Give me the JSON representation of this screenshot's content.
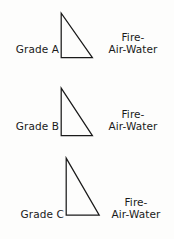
{
  "figure": {
    "background_color": "#fdfdfc",
    "stroke_color": "#1a1a1a",
    "groups": [
      {
        "id": "a",
        "grade_label": "Grade A",
        "elements": {
          "line1": "Fire-",
          "line2": "Air-Water"
        },
        "triangle": {
          "shape": "right-triangle",
          "vertical_leg_left": true,
          "apex_at_top_left": true,
          "width_px": 32,
          "height_px": 45
        }
      },
      {
        "id": "b",
        "grade_label": "Grade B",
        "elements": {
          "line1": "Fire-",
          "line2": "Air-Water"
        },
        "triangle": {
          "shape": "right-triangle",
          "vertical_leg_left": true,
          "apex_at_top_left": true,
          "width_px": 32,
          "height_px": 48
        }
      },
      {
        "id": "c",
        "grade_label": "Grade C",
        "elements": {
          "line1": "Fire-",
          "line2": "Air-Water"
        },
        "triangle": {
          "shape": "right-triangle",
          "vertical_leg_left": true,
          "apex_at_top_left": true,
          "width_px": 34,
          "height_px": 57
        }
      }
    ]
  }
}
